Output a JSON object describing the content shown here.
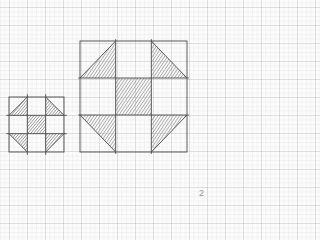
{
  "diagram": {
    "type": "quilt-block-pattern",
    "colors": {
      "paper": "#fbfbfb",
      "grid": "#d0d0d0",
      "outline": "#555555",
      "shading": "#888888"
    },
    "blocks": [
      {
        "name": "small-block",
        "grid": "3x3",
        "x": 9,
        "y": 97,
        "size": 54
      },
      {
        "name": "large-block",
        "grid": "3x3",
        "x": 80,
        "y": 41,
        "size": 107
      }
    ]
  },
  "page_number": "2"
}
